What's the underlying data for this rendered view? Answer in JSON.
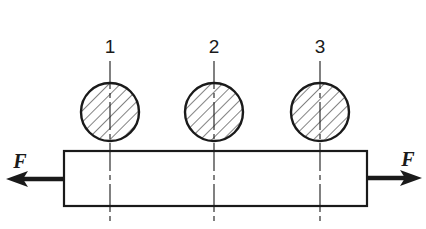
{
  "diagram": {
    "stroke_color": "#1a1a1a",
    "background": "#ffffff",
    "sections": [
      {
        "label": "1",
        "cx": 110,
        "cy": 112,
        "r": 29
      },
      {
        "label": "2",
        "cx": 214,
        "cy": 112,
        "r": 29
      },
      {
        "label": "3",
        "cx": 320,
        "cy": 112,
        "r": 29
      }
    ],
    "bar": {
      "x": 64,
      "y": 151,
      "width": 303,
      "height": 55
    },
    "forces": {
      "left": {
        "label": "F",
        "direction": "left"
      },
      "right": {
        "label": "F",
        "direction": "right"
      }
    }
  }
}
